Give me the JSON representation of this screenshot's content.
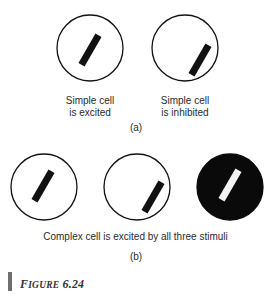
{
  "panel_a": {
    "stimuli": [
      {
        "label_line1": "Simple cell",
        "label_line2": "is excited",
        "background": "white",
        "bar": "black",
        "position": "centered"
      },
      {
        "label_line1": "Simple cell",
        "label_line2": "is inhibited",
        "background": "white",
        "bar": "black",
        "position": "offset-lower-right"
      }
    ],
    "tag": "(a)"
  },
  "panel_b": {
    "stimuli": [
      {
        "background": "white",
        "bar": "black",
        "position": "centered"
      },
      {
        "background": "white",
        "bar": "black",
        "position": "offset-lower-right"
      },
      {
        "background": "black",
        "bar": "white",
        "position": "centered"
      }
    ],
    "caption": "Complex cell is excited by all three stimuli",
    "tag": "(b)"
  },
  "figure": {
    "label_first": "F",
    "label_rest": "IGURE",
    "number": "6.24"
  },
  "colors": {
    "stroke": "#111111",
    "fill_dark": "#0a0a0a",
    "label_bar": "#707070"
  }
}
